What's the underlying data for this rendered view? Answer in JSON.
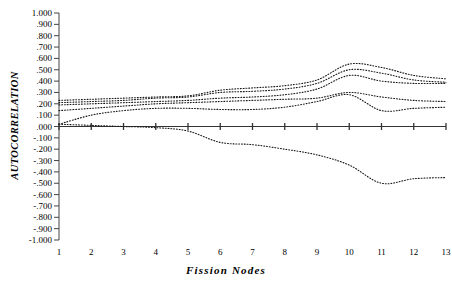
{
  "chart_data": {
    "type": "line",
    "title": "",
    "xlabel": "Fission Nodes",
    "ylabel": "AUTOCORRELATION",
    "x": [
      1,
      2,
      3,
      4,
      5,
      6,
      7,
      8,
      9,
      10,
      11,
      12,
      13
    ],
    "xlim": [
      1,
      13
    ],
    "ylim": [
      -1.0,
      1.0
    ],
    "grid": false,
    "legend": "none",
    "line_style": "dotted",
    "zero_line": true,
    "ytick_labels": [
      "1.000",
      ".900",
      ".800",
      ".700",
      ".600",
      ".500",
      ".400",
      ".300",
      ".200",
      ".100",
      ".000",
      "-.100",
      "-.200",
      "-.300",
      "-.400",
      "-.500",
      "-.600",
      "-.700",
      "-.800",
      "-.900",
      "-1.000"
    ],
    "ytick_values": [
      1.0,
      0.9,
      0.8,
      0.7,
      0.6,
      0.5,
      0.4,
      0.3,
      0.2,
      0.1,
      0.0,
      -0.1,
      -0.2,
      -0.3,
      -0.4,
      -0.5,
      -0.6,
      -0.7,
      -0.8,
      -0.9,
      -1.0
    ],
    "xtick_labels": [
      "1",
      "2",
      "3",
      "4",
      "5",
      "6",
      "7",
      "8",
      "9",
      "10",
      "11",
      "12",
      "13"
    ],
    "series": [
      {
        "name": "series-1",
        "values": [
          0.23,
          0.24,
          0.25,
          0.26,
          0.27,
          0.32,
          0.34,
          0.36,
          0.41,
          0.55,
          0.52,
          0.45,
          0.42
        ]
      },
      {
        "name": "series-2",
        "values": [
          0.21,
          0.22,
          0.23,
          0.25,
          0.26,
          0.3,
          0.31,
          0.33,
          0.38,
          0.5,
          0.47,
          0.41,
          0.39
        ]
      },
      {
        "name": "series-3",
        "values": [
          0.19,
          0.2,
          0.21,
          0.22,
          0.23,
          0.25,
          0.26,
          0.28,
          0.33,
          0.45,
          0.4,
          0.38,
          0.38
        ]
      },
      {
        "name": "series-4",
        "values": [
          0.14,
          0.16,
          0.18,
          0.2,
          0.21,
          0.22,
          0.23,
          0.24,
          0.25,
          0.3,
          0.26,
          0.23,
          0.22
        ]
      },
      {
        "name": "series-5",
        "values": [
          0.02,
          0.1,
          0.14,
          0.16,
          0.16,
          0.15,
          0.15,
          0.17,
          0.22,
          0.28,
          0.14,
          0.16,
          0.17
        ]
      },
      {
        "name": "series-6",
        "values": [
          0.02,
          0.01,
          0.0,
          -0.01,
          -0.04,
          -0.14,
          -0.16,
          -0.2,
          -0.25,
          -0.34,
          -0.5,
          -0.46,
          -0.45
        ]
      }
    ]
  }
}
